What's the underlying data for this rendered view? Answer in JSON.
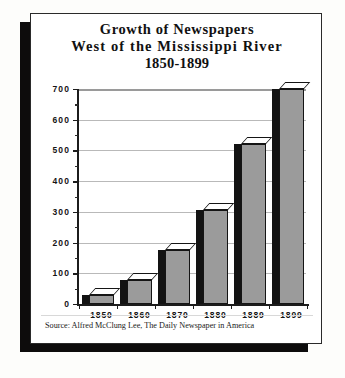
{
  "chart_data": {
    "type": "bar",
    "title": "Growth of Newspapers West of the Mississippi River 1850-1899",
    "title_lines": [
      "Growth of Newspapers",
      "West of the Mississippi River",
      "1850-1899"
    ],
    "categories": [
      "1850",
      "1860",
      "1870",
      "1880",
      "1889",
      "1899"
    ],
    "values": [
      28,
      78,
      175,
      305,
      520,
      700
    ],
    "xlabel": "",
    "ylabel": "",
    "ylim": [
      0,
      700
    ],
    "ytick_labels": [
      "0",
      "100",
      "200",
      "300",
      "400",
      "500",
      "600",
      "700"
    ],
    "ytick_values": [
      0,
      100,
      200,
      300,
      400,
      500,
      600,
      700
    ],
    "yminor_step": 50,
    "grid": true,
    "legend": false,
    "source": "Source: Alfred McClung Lee, The Daily Newspaper in America",
    "bar_face_color": "#9b9b9b",
    "bar_side_color": "#131313",
    "bar_top_color": "#ffffff",
    "gridline_color": "#b9b9b9",
    "axis_color": "#1c1c1c",
    "panel_color": "#ffffff",
    "shadow_color": "#0d0c0c"
  }
}
